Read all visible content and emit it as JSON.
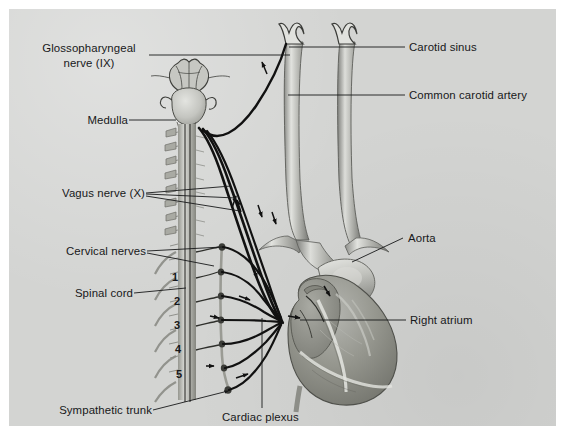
{
  "figure": {
    "background_color": "#d3d4d2",
    "border_color": "#ffffff",
    "ink_color": "#17181a"
  },
  "labels": {
    "glossopharyngeal": {
      "line1": "Glossopharyngeal",
      "line2": "nerve (IX)"
    },
    "medulla": "Medulla",
    "vagus": "Vagus nerve (X)",
    "cervical_nerves": "Cervical nerves",
    "spinal_cord": "Spinal cord",
    "sympathetic_trunk": "Sympathetic trunk",
    "cardiac_plexus": "Cardiac plexus",
    "carotid_sinus": "Carotid sinus",
    "common_carotid_artery": "Common carotid artery",
    "aorta": "Aorta",
    "right_atrium": "Right atrium"
  },
  "segment_numbers": [
    "1",
    "2",
    "3",
    "4",
    "5"
  ],
  "structures": [
    {
      "name": "brainstem",
      "label_ref": "medulla"
    },
    {
      "name": "cerebellum"
    },
    {
      "name": "spinal-cord",
      "label_ref": "spinal_cord"
    },
    {
      "name": "vertebral-column"
    },
    {
      "name": "sympathetic-trunk",
      "label_ref": "sympathetic_trunk"
    },
    {
      "name": "cervical-nerve-roots",
      "label_ref": "cervical_nerves"
    },
    {
      "name": "vagus-nerve",
      "label_ref": "vagus"
    },
    {
      "name": "glossopharyngeal-nerve",
      "label_ref": "glossopharyngeal"
    },
    {
      "name": "cardiac-plexus",
      "label_ref": "cardiac_plexus"
    },
    {
      "name": "left-common-carotid-artery",
      "label_ref": "common_carotid_artery"
    },
    {
      "name": "right-common-carotid-artery",
      "label_ref": "common_carotid_artery"
    },
    {
      "name": "carotid-sinus",
      "label_ref": "carotid_sinus"
    },
    {
      "name": "aortic-arch",
      "label_ref": "aorta"
    },
    {
      "name": "heart",
      "label_ref": "right_atrium"
    }
  ]
}
